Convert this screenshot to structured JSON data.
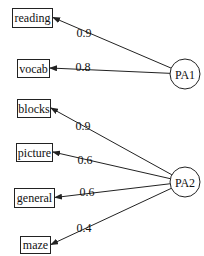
{
  "diagram": {
    "type": "factor-loading-path-diagram",
    "factors": [
      {
        "id": "PA1",
        "label": "PA1",
        "cx": 185,
        "cy": 74,
        "r": 15
      },
      {
        "id": "PA2",
        "label": "PA2",
        "cx": 185,
        "cy": 182,
        "r": 15
      }
    ],
    "variables": [
      {
        "id": "reading",
        "label": "reading",
        "x": 12,
        "y": 8,
        "w": 40,
        "h": 19
      },
      {
        "id": "vocab",
        "label": "vocab",
        "x": 17,
        "y": 59,
        "w": 32,
        "h": 18
      },
      {
        "id": "blocks",
        "label": "blocks",
        "x": 17,
        "y": 99,
        "w": 33,
        "h": 18
      },
      {
        "id": "picture",
        "label": "picture",
        "x": 16,
        "y": 143,
        "w": 36,
        "h": 18
      },
      {
        "id": "general",
        "label": "general",
        "x": 14,
        "y": 188,
        "w": 40,
        "h": 19
      },
      {
        "id": "maze",
        "label": "maze",
        "x": 20,
        "y": 236,
        "w": 30,
        "h": 17
      }
    ],
    "edges": [
      {
        "from": "PA1",
        "to": "reading",
        "loading": "0.9",
        "lx": 84,
        "ly": 37
      },
      {
        "from": "PA1",
        "to": "vocab",
        "loading": "0.8",
        "lx": 83,
        "ly": 71
      },
      {
        "from": "PA2",
        "to": "blocks",
        "loading": "0.9",
        "lx": 83,
        "ly": 130
      },
      {
        "from": "PA2",
        "to": "picture",
        "loading": "0.6",
        "lx": 85,
        "ly": 164
      },
      {
        "from": "PA2",
        "to": "general",
        "loading": "0.6",
        "lx": 87,
        "ly": 196
      },
      {
        "from": "PA2",
        "to": "maze",
        "loading": "0.4",
        "lx": 84,
        "ly": 232
      }
    ]
  }
}
